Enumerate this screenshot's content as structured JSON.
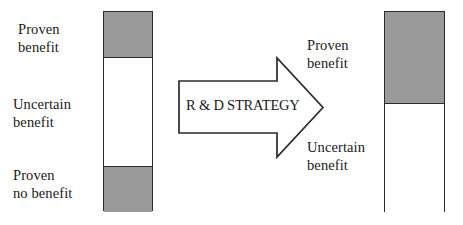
{
  "diagram": {
    "colors": {
      "gray_fill": "#9a9a9a",
      "white_fill": "#ffffff",
      "outline": "#2b2b2b",
      "text": "#1a1a1a",
      "background": "#ffffff"
    },
    "left_bar": {
      "name": "before-rd-strategy-bar",
      "segments": [
        {
          "key": "proven_benefit",
          "label": "Proven\nbenefit",
          "fill": "gray",
          "fraction": 0.23
        },
        {
          "key": "uncertain_benefit",
          "label": "Uncertain\nbenefit",
          "fill": "white",
          "fraction": 0.54
        },
        {
          "key": "proven_no_benefit",
          "label": "Proven\nno benefit",
          "fill": "gray",
          "fraction": 0.23
        }
      ]
    },
    "right_bar": {
      "name": "after-rd-strategy-bar",
      "segments": [
        {
          "key": "proven_benefit",
          "label": "Proven\nbenefit",
          "fill": "gray",
          "fraction": 0.46
        },
        {
          "key": "uncertain_benefit",
          "label": "Uncertain\nbenefit",
          "fill": "white",
          "fraction": 0.54
        }
      ]
    },
    "arrow": {
      "name": "rd-strategy-arrow",
      "label": "R & D STRATEGY",
      "direction": "right"
    }
  }
}
